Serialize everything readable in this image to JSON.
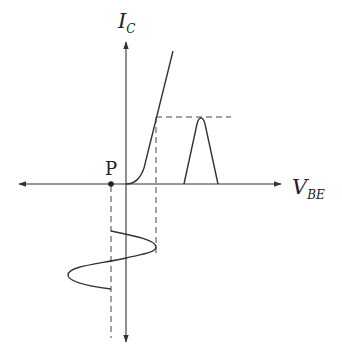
{
  "diagram": {
    "colors": {
      "stroke": "#333333",
      "background": "#ffffff"
    },
    "axes": {
      "vertical": {
        "label_main": "I",
        "label_sub": "C"
      },
      "horizontal": {
        "label_main": "V",
        "label_sub": "BE"
      }
    },
    "point": {
      "label": "P"
    },
    "elements": [
      "characteristic-curve",
      "input-sine-wave",
      "output-current-pulse",
      "dashed-projection-lines"
    ]
  }
}
